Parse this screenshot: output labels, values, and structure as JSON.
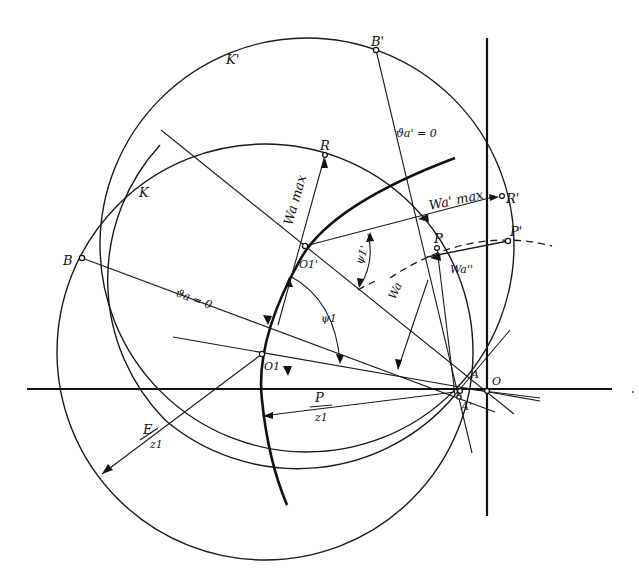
{
  "figure": {
    "type": "geometric construction diagram",
    "colors": {
      "ink": "#111111",
      "background": "#ffffff"
    }
  },
  "labels": {
    "K_prime": "K'",
    "K": "K",
    "B_prime": "B'",
    "B": "B",
    "R": "R",
    "R_prime": "R'",
    "P": "P",
    "P_prime": "P'",
    "O1_prime": "O1'",
    "O1": "O1",
    "A": "A",
    "A_prime": "A'",
    "O": "O",
    "theta_a_prime_zero": "ϑa' = 0",
    "theta_a_zero": "ϑa = 0",
    "W_a_max": "Wa max",
    "W_a_prime_max": "Wa' max",
    "W_a_dprime": "Wa''",
    "W_a": "Wa",
    "psi1_prime": "ψ1'",
    "psi1": "ψ1",
    "P_over_z1_num": "P",
    "P_over_z1_den": "z1",
    "E_over_z1_num": "E",
    "E_over_z1_den": "z1"
  },
  "points": [
    {
      "name": "B'",
      "x": 376,
      "y": 50
    },
    {
      "name": "B",
      "x": 82,
      "y": 258
    },
    {
      "name": "R",
      "x": 325,
      "y": 155
    },
    {
      "name": "R'",
      "x": 502,
      "y": 196
    },
    {
      "name": "P",
      "x": 437,
      "y": 248
    },
    {
      "name": "P'",
      "x": 508,
      "y": 241
    },
    {
      "name": "O1'",
      "x": 305,
      "y": 246
    },
    {
      "name": "O1",
      "x": 262,
      "y": 354
    },
    {
      "name": "A",
      "x": 460,
      "y": 390
    },
    {
      "name": "A'",
      "x": 458,
      "y": 396
    },
    {
      "name": "O",
      "x": 487,
      "y": 390
    }
  ],
  "circles": [
    {
      "name": "K'",
      "cx": 307,
      "cy": 245,
      "r": 207
    },
    {
      "name": "K",
      "cx": 265,
      "cy": 352,
      "r": 208
    }
  ]
}
